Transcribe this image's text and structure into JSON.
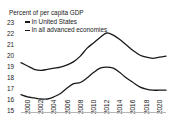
{
  "chart_data": {
    "type": "line",
    "title": "Percent of per capita GDP",
    "xlabel": "",
    "ylabel": "Percent of per capita GDP",
    "x": [
      2000,
      2001,
      2002,
      2003,
      2004,
      2005,
      2006,
      2007,
      2008,
      2009,
      2010,
      2011,
      2012,
      2013,
      2014,
      2015,
      2016,
      2017,
      2018,
      2019,
      2020,
      2021,
      2022
    ],
    "xtick_labels": [
      "2000",
      "2002",
      "2004",
      "2006",
      "2008",
      "2010",
      "2012",
      "2014",
      "2016",
      "2018",
      "2020",
      "2022"
    ],
    "xticks": [
      2000,
      2002,
      2004,
      2006,
      2008,
      2010,
      2012,
      2014,
      2016,
      2018,
      2020,
      2022
    ],
    "ytick_labels": [
      "23",
      "22",
      "21",
      "20",
      "19",
      "18",
      "17",
      "16",
      "15"
    ],
    "yticks": [
      23,
      22,
      21,
      20,
      19,
      18,
      17,
      16,
      15
    ],
    "ylim": [
      15,
      23
    ],
    "xlim": [
      2000,
      2022
    ],
    "grid": false,
    "legend_position": "top-left",
    "series": [
      {
        "name": "In United States",
        "color": "#1a1a1a",
        "values": [
          19.3,
          19.0,
          18.7,
          18.6,
          18.7,
          18.8,
          18.9,
          19.1,
          19.4,
          19.9,
          20.6,
          21.1,
          21.6,
          22.0,
          21.8,
          21.4,
          20.9,
          20.4,
          20.0,
          19.8,
          19.7,
          19.8,
          19.9
        ]
      },
      {
        "name": "In all advanced economies",
        "color": "#1a1a1a",
        "values": [
          16.4,
          16.2,
          16.1,
          16.0,
          16.0,
          16.2,
          16.5,
          17.0,
          17.4,
          17.5,
          17.9,
          18.4,
          18.8,
          18.9,
          18.8,
          18.4,
          17.9,
          17.5,
          17.1,
          16.9,
          16.8,
          16.8,
          16.8
        ]
      }
    ]
  },
  "legend": {
    "items": [
      {
        "label": "In United States"
      },
      {
        "label": "In all advanced economies"
      }
    ]
  }
}
